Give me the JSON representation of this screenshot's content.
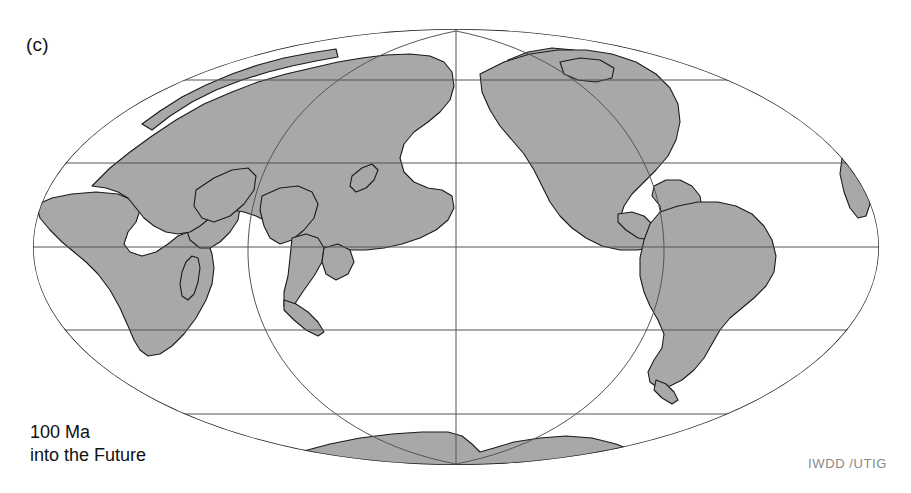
{
  "figure": {
    "panel_label": "(c)",
    "age_line1": "100 Ma",
    "age_line2": "into the Future",
    "credit": "IWDD /UTIG",
    "background_color": "#ffffff",
    "land_fill_color": "#a8a8a8",
    "coastline_color": "#1a1a1a",
    "graticule_color": "#555555",
    "outline_color": "#222222",
    "label_color": "#111111",
    "credit_color": "#888888"
  },
  "map": {
    "projection": "mollweide",
    "central_meridian_px": 456,
    "equator_px": 247,
    "semi_major_px": 423,
    "semi_minor_px": 218,
    "graticule": {
      "parallels_deg": [
        60,
        30,
        0,
        -30,
        -60
      ],
      "parallels_px_y": [
        80,
        163,
        247,
        330,
        414
      ],
      "meridians_deg": [
        0,
        90,
        -90
      ],
      "grid_on": true
    },
    "labels_visible": false,
    "landmasses": [
      "Africa",
      "Madagascar",
      "Eurasia",
      "India",
      "Arabia",
      "Southeast Asia",
      "Borneo",
      "Indonesia",
      "Japan",
      "North America",
      "Greenland",
      "Central America",
      "South America",
      "Antarctica",
      "Australia-fragment"
    ]
  }
}
